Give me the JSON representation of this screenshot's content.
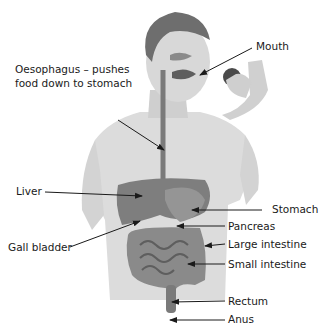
{
  "diagram": {
    "labels": [
      {
        "id": "mouth",
        "text": "Mouth"
      },
      {
        "id": "oesophagus",
        "line1": "Oesophagus – pushes",
        "line2": "food down to stomach"
      },
      {
        "id": "liver",
        "text": "Liver"
      },
      {
        "id": "stomach",
        "text": "Stomach"
      },
      {
        "id": "gall_bladder",
        "text": "Gall bladder"
      },
      {
        "id": "pancreas",
        "text": "Pancreas"
      },
      {
        "id": "large_intestine",
        "text": "Large intestine"
      },
      {
        "id": "small_intestine",
        "text": "Small intestine"
      },
      {
        "id": "rectum",
        "text": "Rectum"
      },
      {
        "id": "anus",
        "text": "Anus"
      }
    ],
    "colors": {
      "skin": "#d9d9d9",
      "skin_shade": "#c4c4c4",
      "hair": "#6e6e6e",
      "organ": "#8a8a8a",
      "organ_dark": "#5e5e5e",
      "arrow": "#1a1a1a"
    }
  }
}
